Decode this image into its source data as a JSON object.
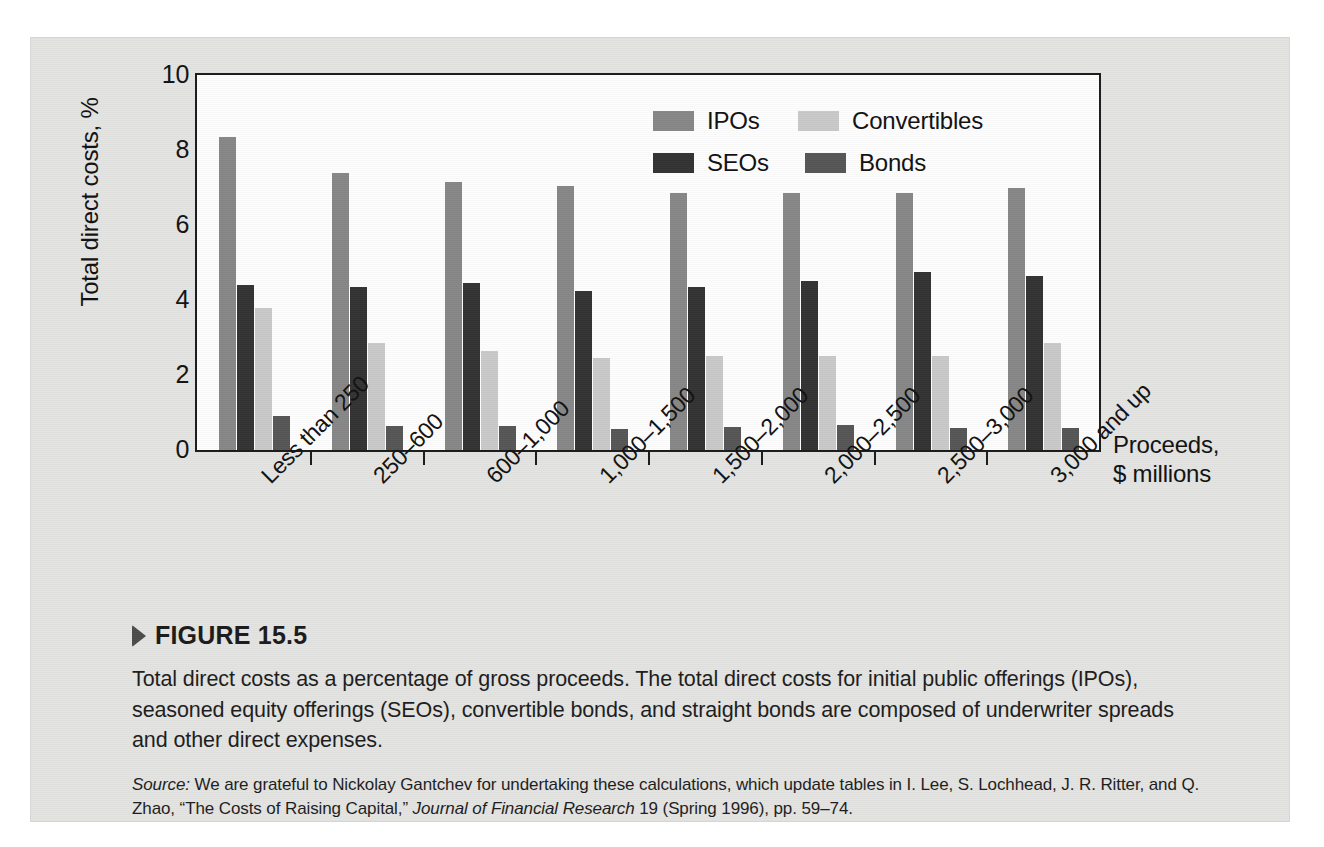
{
  "figure": {
    "marker_icon": "triangle-right-icon",
    "title": "FIGURE 15.5",
    "caption": "Total direct costs as a percentage of gross proceeds. The total direct costs for initial public offerings (IPOs), seasoned equity offerings (SEOs), convertible bonds, and straight bonds are composed of underwriter spreads and other direct expenses.",
    "source_label": "Source:",
    "source_body": "We are grateful to Nickolay Gantchev for undertaking these calculations, which update tables in I. Lee, S. Lochhead, J. R. Ritter, and Q. Zhao, “The Costs of Raising Capital,”",
    "source_journal": "Journal of Financial Research",
    "source_tail": "19 (Spring 1996), pp. 59–74."
  },
  "chart_data": {
    "type": "bar",
    "title": "",
    "subtitle": "",
    "xlabel": "Proceeds, $ millions",
    "xlabel_line1": "Proceeds,",
    "xlabel_line2": "$ millions",
    "ylabel": "Total direct costs, %",
    "ylim": [
      0,
      10
    ],
    "yticks": [
      0,
      2,
      4,
      6,
      8,
      10
    ],
    "ytick_labels": [
      "0",
      "2",
      "4",
      "6",
      "8",
      "10"
    ],
    "grid": false,
    "legend_position": "inside-top-center",
    "orientation": "vertical",
    "grouped": true,
    "categories": [
      "Less than 250",
      "250–600",
      "600–1,000",
      "1,000–1,500",
      "1,500–2,000",
      "2,000–2,500",
      "2,500–3,000",
      "3,000 and up"
    ],
    "series": [
      {
        "name": "IPOs",
        "color": "#878787",
        "values": [
          8.35,
          7.4,
          7.15,
          7.05,
          6.85,
          6.85,
          6.85,
          7.0
        ]
      },
      {
        "name": "SEOs",
        "color": "#333333",
        "values": [
          4.4,
          4.35,
          4.45,
          4.25,
          4.35,
          4.5,
          4.75,
          4.65
        ]
      },
      {
        "name": "Convertibles",
        "color": "#c9c9c9",
        "values": [
          3.8,
          2.85,
          2.65,
          2.45,
          2.5,
          2.5,
          2.5,
          2.85
        ]
      },
      {
        "name": "Bonds",
        "color": "#565656",
        "values": [
          0.9,
          0.65,
          0.65,
          0.55,
          0.62,
          0.68,
          0.6,
          0.6
        ]
      }
    ]
  },
  "legend": {
    "rows": [
      {
        "left": {
          "label": "IPOs",
          "color": "#878787"
        },
        "right": {
          "label": "Convertibles",
          "color": "#c9c9c9"
        }
      },
      {
        "left": {
          "label": "SEOs",
          "color": "#333333"
        },
        "right": {
          "label": "Bonds",
          "color": "#565656"
        }
      }
    ]
  },
  "colors": {
    "page_background": "#ffffff",
    "card_background": "#e3e3e1",
    "plot_background": "#fdfdfd",
    "axis": "#1c1c1c",
    "text": "#111111"
  }
}
